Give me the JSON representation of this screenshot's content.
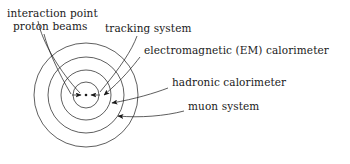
{
  "figure": {
    "kind": "detector-cross-section-diagram",
    "background_color": "#ffffff",
    "stroke_color": "#1a1a1a",
    "text_color": "#1a1a1a",
    "width": 350,
    "height": 164
  },
  "center": {
    "label": "interaction-point",
    "x": 86,
    "y": 95,
    "dot_radius": 1.3
  },
  "layers": [
    {
      "name": "tracking system",
      "radius": 13
    },
    {
      "name": "electromagnetic (EM) calorimeter",
      "radius": 25
    },
    {
      "name": "hadronic calorimeter",
      "radius": 38
    },
    {
      "name": "muon system",
      "radius": 52
    }
  ],
  "beams": [
    {
      "name": "proton-beam-left",
      "from_x": 72,
      "from_y": 95,
      "to_x": 81,
      "to_y": 95
    },
    {
      "name": "proton-beam-right",
      "from_x": 100,
      "from_y": 95,
      "to_x": 91,
      "to_y": 95
    }
  ],
  "labels": {
    "interaction_point": "interaction point",
    "proton_beams": "proton beams",
    "tracking_system": "tracking system",
    "em_calorimeter": "electromagnetic (EM) calorimeter",
    "hadronic_calorimeter": "hadronic calorimeter",
    "muon_system": "muon system"
  },
  "leader_lines": [
    {
      "name": "leader-interaction-point",
      "path": "M 38 21 C 42 42, 60 72, 80 93"
    },
    {
      "name": "leader-proton-beams",
      "path": "M 44 34 C 48 50, 58 72, 71 94"
    },
    {
      "name": "leader-tracking-system",
      "path": "M 137 36 C 132 50, 120 68, 100 92"
    },
    {
      "name": "leader-em-calorimeter",
      "path": "M 140 57 C 133 66, 122 80, 104 95"
    },
    {
      "name": "leader-hadronic-calorimeter",
      "path": "M 168 88 C 155 93, 135 99, 112 103"
    },
    {
      "name": "leader-muon-system",
      "path": "M 184 111 C 165 116, 140 118, 118 116"
    }
  ]
}
